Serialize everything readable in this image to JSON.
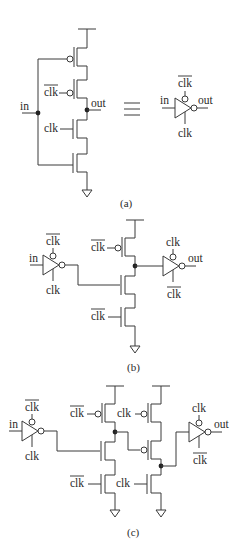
{
  "figure": {
    "panels": [
      {
        "id": "a",
        "caption": "(a)",
        "labels": {
          "in": "in",
          "out": "out",
          "clk_bar": "clk",
          "clk": "clk",
          "equiv": "≡",
          "sym_in": "in",
          "sym_out": "out",
          "sym_clk_bar": "clk",
          "sym_clk": "clk"
        }
      },
      {
        "id": "b",
        "caption": "(b)",
        "labels": {
          "in": "in",
          "inv1_top": "clk",
          "inv1_bot": "clk",
          "pmos_gate": "clk",
          "nmos_clk_gate": "clk",
          "inv2_top": "clk",
          "inv2_bot": "clk",
          "out": "out"
        }
      },
      {
        "id": "c",
        "caption": "(c)",
        "labels": {
          "in": "in",
          "inv1_top": "clk",
          "inv1_bot": "clk",
          "p1_gate": "clk",
          "n1_clk_gate": "clk",
          "p2_gate": "clk",
          "n2_clk_gate": "clk",
          "inv2_top": "clk",
          "inv2_bot": "clk",
          "out": "out"
        }
      }
    ]
  },
  "colors": {
    "wire": "#3a3a3a",
    "node": "#222222",
    "text": "#2a2a2a",
    "background": "#ffffff"
  }
}
